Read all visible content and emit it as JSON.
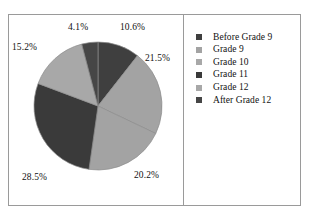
{
  "chart_data": {
    "type": "pie",
    "title": "",
    "subtitle": "",
    "xlabel": "",
    "ylabel": "",
    "legend_position": "right",
    "grid": false,
    "start_angle_deg": 0,
    "direction": "clockwise",
    "categories": [
      "Before Grade 9",
      "Grade 9",
      "Grade 10",
      "Grade 11",
      "Grade 12",
      "After Grade 12"
    ],
    "values": [
      10.6,
      21.5,
      20.2,
      28.5,
      15.2,
      4.1
    ],
    "value_unit": "%",
    "data_labels": [
      "10.6%",
      "21.5%",
      "20.2%",
      "28.5%",
      "15.2%",
      "4.1%"
    ],
    "slice_colors": [
      "#3f3f3f",
      "#a3a3a3",
      "#a3a3a3",
      "#3a3a3a",
      "#a8a8a8",
      "#464646"
    ],
    "legend_swatch_colors": [
      "#3f3f3f",
      "#a3a3a3",
      "#a8a8a8",
      "#3a3a3a",
      "#a8a8a8",
      "#464646"
    ]
  },
  "chart": {
    "slices": [
      {
        "category": "Before Grade 9",
        "value": 10.6,
        "label": "10.6%",
        "color": "#3f3f3f",
        "label_left": "111px",
        "label_top": "7px"
      },
      {
        "category": "Grade 9",
        "value": 21.5,
        "label": "21.5%",
        "color": "#a3a3a3",
        "label_left": "136px",
        "label_top": "38px"
      },
      {
        "category": "Grade 10",
        "value": 20.2,
        "label": "20.2%",
        "color": "#a3a3a3",
        "label_left": "125px",
        "label_top": "155px"
      },
      {
        "category": "Grade 11",
        "value": 28.5,
        "label": "28.5%",
        "color": "#3a3a3a",
        "label_left": "13px",
        "label_top": "157px"
      },
      {
        "category": "Grade 12",
        "value": 15.2,
        "label": "15.2%",
        "color": "#a8a8a8",
        "label_left": "3px",
        "label_top": "27px"
      },
      {
        "category": "After Grade 12",
        "value": 4.1,
        "label": "4.1%",
        "color": "#464646",
        "label_left": "59px",
        "label_top": "7px"
      }
    ]
  },
  "legend": {
    "items": [
      {
        "label": "Before Grade 9",
        "color": "#3f3f3f"
      },
      {
        "label": "Grade 9",
        "color": "#a3a3a3"
      },
      {
        "label": "Grade 10",
        "color": "#a8a8a8"
      },
      {
        "label": "Grade 11",
        "color": "#3a3a3a"
      },
      {
        "label": "Grade 12",
        "color": "#a8a8a8"
      },
      {
        "label": "After Grade 12",
        "color": "#464646"
      }
    ]
  },
  "style": {
    "background": "#ffffff",
    "frame_color": "#9a9a9a",
    "text_color": "#111111"
  }
}
